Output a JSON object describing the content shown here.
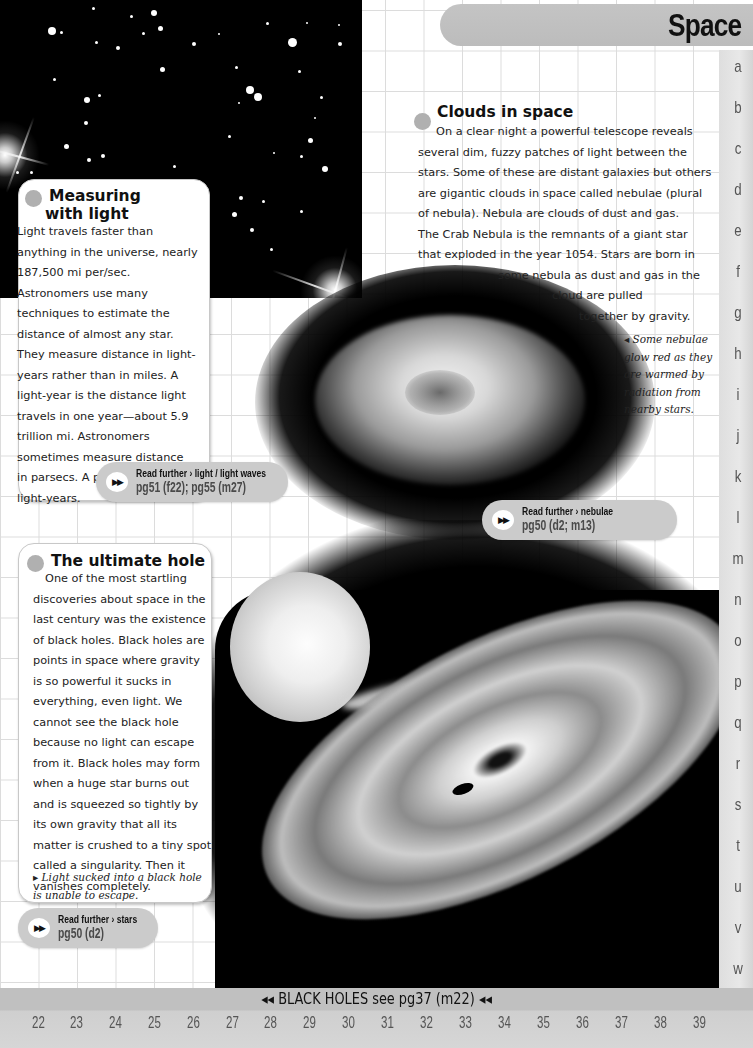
{
  "header": {
    "title": "Space"
  },
  "side_index": [
    "a",
    "b",
    "c",
    "d",
    "e",
    "f",
    "g",
    "h",
    "i",
    "j",
    "k",
    "l",
    "m",
    "n",
    "o",
    "p",
    "q",
    "r",
    "s",
    "t",
    "u",
    "v",
    "w"
  ],
  "panels": {
    "measuring": {
      "title_line1": "Measuring",
      "title_line2": "with light",
      "body": [
        "Light travels faster than",
        "anything in the universe, nearly",
        "187,500 mi per/sec.",
        "Astronomers use many",
        "techniques to estimate the",
        "distance of almost any star.",
        "They measure distance in light-",
        "years rather than in miles. A",
        "light-year is the distance light",
        "travels in one year—about 5.9",
        "trillion mi. Astronomers",
        "sometimes measure distance",
        "in parsecs. A parsec is 3.26",
        "light-years."
      ],
      "read_further": {
        "icon": "fast-forward-icon",
        "label": "Read further › light / light waves",
        "ref": "pg51 (f22); pg55 (m27)"
      }
    },
    "clouds": {
      "title": "Clouds in space",
      "body": [
        "On a clear night a powerful telescope reveals",
        "several dim, fuzzy patches of light between the",
        "stars. Some of these are distant galaxies but others",
        "are gigantic clouds in space called nebulae (plural",
        "of nebula). Nebula are clouds of dust and gas.",
        "The Crab Nebula is the remnants of a giant star",
        "that exploded in the year 1054. Stars are born in",
        "some nebula as dust and gas in the",
        "cloud are pulled",
        "together by gravity."
      ],
      "caption": [
        "◂ Some nebulae",
        "glow red as they",
        "are warmed by",
        "radiation from",
        "nearby stars."
      ],
      "read_further": {
        "icon": "fast-forward-icon",
        "label": "Read further › nebulae",
        "ref": "pg50 (d2; m13)"
      }
    },
    "hole": {
      "title": "The ultimate hole",
      "body": [
        "One of the most startling",
        "discoveries about space in the",
        "last century was the existence",
        "of black holes. Black holes are",
        "points in space where gravity",
        "is so powerful it sucks in",
        "everything, even light. We",
        "cannot see the black hole",
        "because no light can escape",
        "from it. Black holes may form",
        "when a huge star burns out",
        "and is squeezed so tightly by",
        "its own gravity that all its",
        "matter is crushed to a tiny spot",
        "called a singularity. Then it",
        "vanishes completely."
      ],
      "caption": [
        "▸ Light sucked into a black hole",
        "is unable to escape."
      ],
      "read_further": {
        "icon": "fast-forward-icon",
        "label": "Read further › stars",
        "ref": "pg50 (d2)"
      }
    }
  },
  "footer": {
    "cross_reference": "◂◂ BLACK HOLES see pg37 (m22) ◂◂",
    "page_numbers": [
      "22",
      "23",
      "24",
      "25",
      "26",
      "27",
      "28",
      "29",
      "30",
      "31",
      "32",
      "33",
      "34",
      "35",
      "36",
      "37",
      "38",
      "39"
    ]
  },
  "images": {
    "starfield": "star-field-photo",
    "nebula": "nebula-photo",
    "black_hole": "black-hole-illustration"
  }
}
